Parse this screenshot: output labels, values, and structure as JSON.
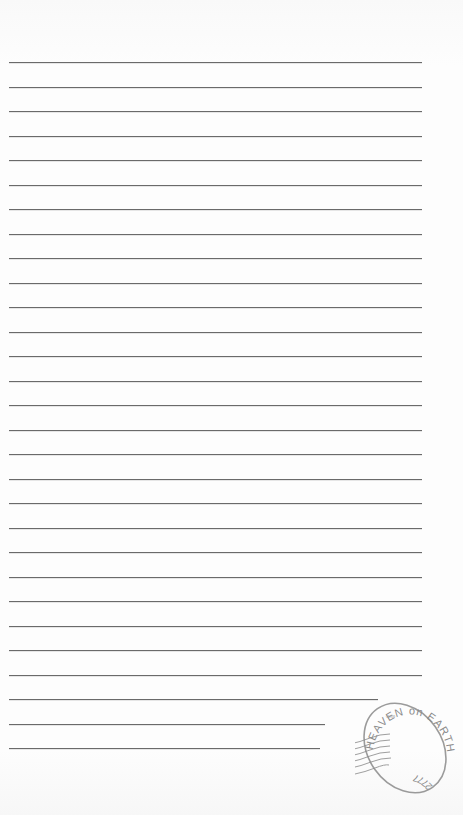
{
  "page": {
    "background": "#fbfbfb",
    "line_color": "#6a6a6a",
    "lines": {
      "count": 29,
      "first_y": 62,
      "spacing": 24.5,
      "x_start": 9,
      "x_end_default": 422,
      "short_line_ends": {
        "26": 378,
        "27": 325,
        "28": 320
      }
    }
  },
  "stamp": {
    "top_text": "HEAVEN on EARTH",
    "center_text": "·ЯЯЯ·",
    "bottom_text": "2777",
    "color": "#8a8a8a"
  }
}
